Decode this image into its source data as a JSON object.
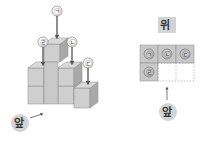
{
  "left_figure": {
    "labels": [
      "㉠",
      "㉡",
      "㉢",
      "㉣"
    ],
    "front_label": "앞"
  },
  "right_figure": {
    "title": "위",
    "grid": [
      [
        "㉠",
        "㉡",
        "㉢"
      ],
      [
        "㉣",
        "",
        ""
      ]
    ],
    "front_label": "앞"
  },
  "colors": {
    "cube_top": "#d9d9d9",
    "cube_front": "#cfcfcf",
    "cube_side": "#a9a9a9",
    "cell_fill": "#c8c8c8",
    "label_bg": "#d3d3d3"
  }
}
